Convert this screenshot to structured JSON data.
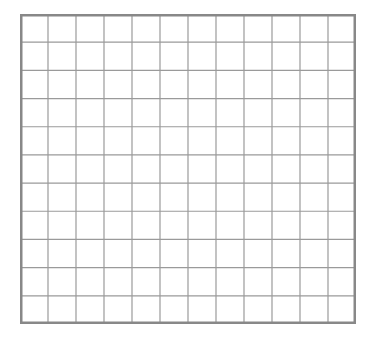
{
  "grid": {
    "columns": 12,
    "rows": 11,
    "line_color": "#9a9a9a",
    "border_color": "#888888",
    "background": "#ffffff"
  }
}
